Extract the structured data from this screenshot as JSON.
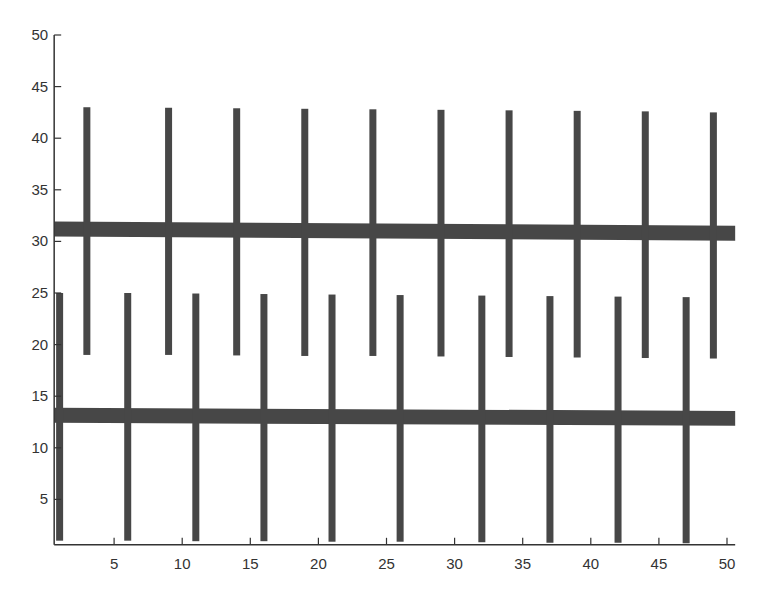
{
  "chart_data": {
    "type": "bar",
    "title": "",
    "xlabel": "",
    "ylabel": "",
    "xlim": [
      0.6,
      50.6
    ],
    "ylim": [
      0.6,
      50.5
    ],
    "grid": false,
    "legend": null,
    "xticks": [
      5,
      10,
      15,
      20,
      25,
      30,
      35,
      40,
      45,
      50
    ],
    "yticks": [
      5,
      10,
      15,
      20,
      25,
      30,
      35,
      40,
      45,
      50
    ],
    "colors": {
      "bars": "#474747",
      "axis": "#333333",
      "background": "#ffffff"
    },
    "horizontal_bands": [
      {
        "name": "upper-band",
        "x_start": 0.6,
        "x_end": 50.6,
        "y_center_start": 31.2,
        "y_center_end": 30.8,
        "thickness": 1.45
      },
      {
        "name": "lower-band",
        "x_start": 0.6,
        "x_end": 50.6,
        "y_center_start": 13.15,
        "y_center_end": 12.85,
        "thickness": 1.45
      }
    ],
    "series": [
      {
        "name": "upper-vertical-bars",
        "x": [
          3,
          9,
          14,
          19,
          24,
          29,
          34,
          39,
          44,
          49
        ],
        "y_bottom": [
          19.0,
          19.0,
          18.95,
          18.9,
          18.9,
          18.85,
          18.8,
          18.75,
          18.7,
          18.65
        ],
        "y_top": [
          43.0,
          42.95,
          42.9,
          42.85,
          42.8,
          42.75,
          42.7,
          42.65,
          42.6,
          42.5
        ]
      },
      {
        "name": "lower-vertical-bars",
        "x": [
          1,
          6,
          11,
          16,
          21,
          26,
          32,
          37,
          42,
          47
        ],
        "y_bottom": [
          1.0,
          1.0,
          0.95,
          0.95,
          0.9,
          0.9,
          0.85,
          0.8,
          0.8,
          0.75
        ],
        "y_top": [
          25.0,
          25.0,
          24.95,
          24.9,
          24.85,
          24.8,
          24.75,
          24.7,
          24.65,
          24.6
        ]
      }
    ]
  }
}
